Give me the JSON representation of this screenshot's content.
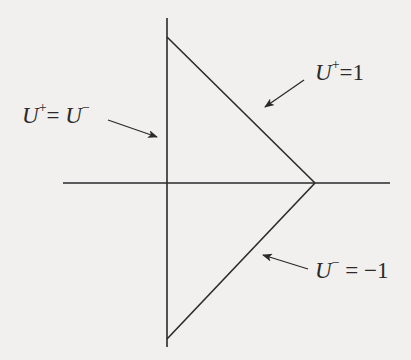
{
  "diagram": {
    "title": "",
    "colors": {
      "background": "#f1f0ee",
      "stroke": "#2a2a2a"
    },
    "axes": {
      "horizontal": {
        "x1": 63,
        "y1": 183,
        "x2": 390,
        "y2": 183
      },
      "vertical": {
        "x1": 167,
        "y1": 18,
        "x2": 167,
        "y2": 347
      }
    },
    "triangle": {
      "vertices": [
        [
          167,
          37
        ],
        [
          315,
          183
        ],
        [
          167,
          339
        ]
      ]
    },
    "labels": {
      "left": {
        "var1": "U",
        "sup1": "+",
        "op": "= ",
        "var2": "U",
        "sup2": "−"
      },
      "top_right": {
        "var1": "U",
        "sup1": "+",
        "op": "=",
        "value": "1"
      },
      "bottom_right": {
        "var1": "U",
        "sup1": "−",
        "op": " = ",
        "value": "−1"
      }
    },
    "arrows": [
      {
        "name": "arrow-left-label",
        "from": [
          108,
          120
        ],
        "to": [
          157,
          137
        ]
      },
      {
        "name": "arrow-top-right-label",
        "from": [
          304,
          80
        ],
        "to": [
          265,
          107
        ]
      },
      {
        "name": "arrow-bottom-right-label",
        "from": [
          308,
          269
        ],
        "to": [
          263,
          255
        ]
      }
    ]
  }
}
